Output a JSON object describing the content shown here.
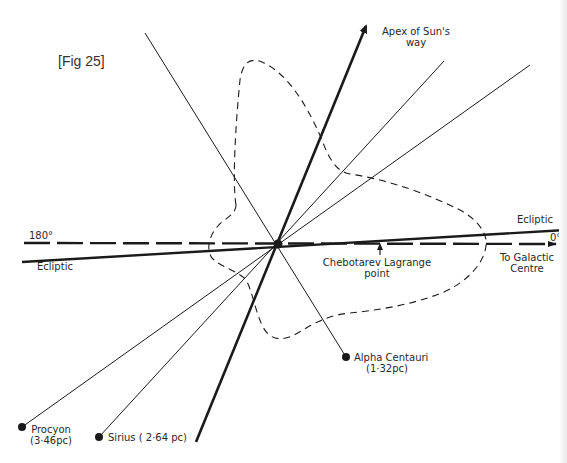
{
  "figure": {
    "label": "[Fig 25]"
  },
  "labels": {
    "apex_line1": "Apex of Sun's",
    "apex_line2": "way",
    "ecliptic_right": "Ecliptic",
    "ecliptic_left": "Ecliptic",
    "deg_180": "180°",
    "deg_0": "0°",
    "galactic_line1": "To Galactic",
    "galactic_line2": "Centre",
    "lagrange_line1": "Chebotarev Lagrange",
    "lagrange_line2": "point"
  },
  "stars": [
    {
      "name": "Alpha Centauri",
      "distance": "(1·32pc)"
    },
    {
      "name": "Procyon",
      "distance": "(3·46pc)"
    },
    {
      "name": "Sirius",
      "distance": "Sirius ( 2·64 pc)"
    }
  ],
  "colors": {
    "ink": "#1a1a1a",
    "background": "#ffffff"
  }
}
